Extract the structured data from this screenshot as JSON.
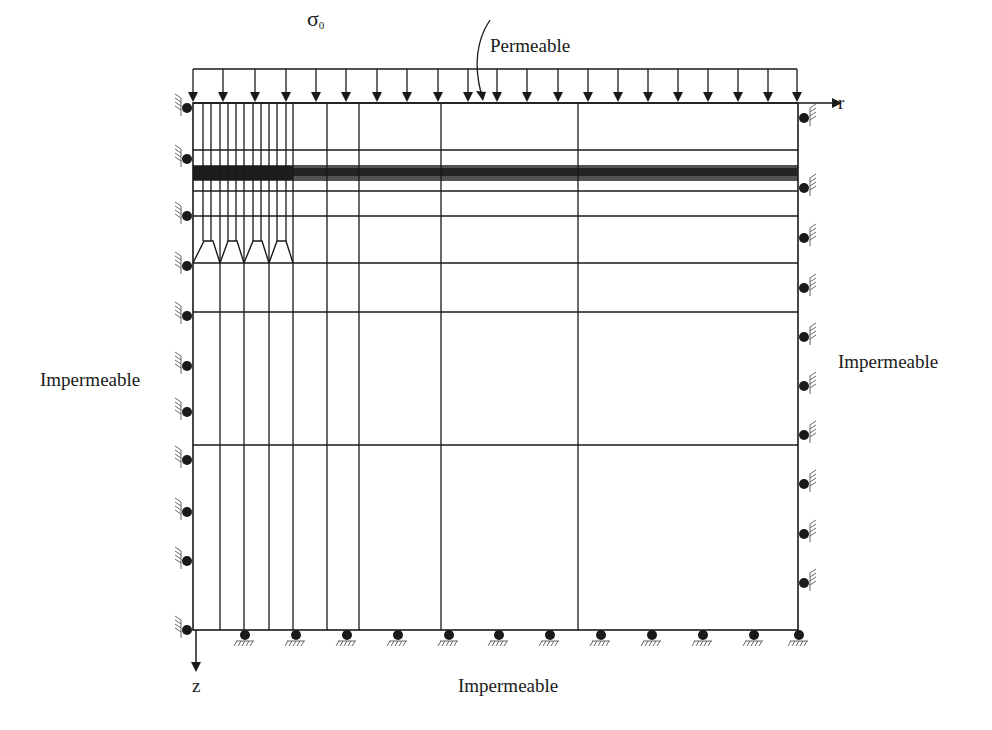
{
  "labels": {
    "load": {
      "symbol": "σ",
      "subscript": "0",
      "x": 307,
      "y": 8
    },
    "permeable_top": {
      "text": "Permeable",
      "x": 490,
      "y": 36
    },
    "impermeable_left": {
      "text": "Impermeable",
      "x": 40,
      "y": 370
    },
    "impermeable_right": {
      "text": "Impermeable",
      "x": 838,
      "y": 352
    },
    "impermeable_bottom": {
      "text": "Impermeable",
      "x": 458,
      "y": 676
    },
    "axis_r": {
      "text": "r",
      "x": 838,
      "y": 93
    },
    "axis_z": {
      "text": "z",
      "x": 192,
      "y": 676
    }
  },
  "colors": {
    "line": "#1a1a1a",
    "fixity_hatch": "#555555",
    "background": "#ffffff"
  },
  "geometry": {
    "domain": {
      "left": 193,
      "right": 798,
      "top": 103,
      "bottom": 630
    },
    "load_box": {
      "left": 193,
      "right": 797,
      "top": 69
    },
    "load_arrow_x": [
      193,
      223,
      255,
      286,
      316,
      346,
      377,
      407,
      438,
      468,
      497,
      527,
      558,
      588,
      618,
      648,
      678,
      708,
      738,
      768,
      797
    ],
    "r_axis": {
      "x_end": 832,
      "y": 103
    },
    "z_axis": {
      "x": 196,
      "y_end": 662
    },
    "permeable_pointer": {
      "start": [
        490,
        20
      ],
      "ctrl": [
        470,
        50
      ],
      "end": [
        485,
        101
      ]
    },
    "fine_columns_x": [
      203,
      211,
      220,
      228,
      236,
      244,
      253,
      261,
      269,
      277,
      286,
      293
    ],
    "mid_columns_x": [
      327,
      359,
      441,
      578
    ],
    "horizontal_rows_y": [
      150,
      166,
      168,
      170,
      172,
      174,
      176,
      178,
      180,
      191,
      216,
      263,
      312,
      445
    ],
    "dense_band": {
      "top": 166,
      "bottom": 180
    },
    "wedges": [
      {
        "left_base": 193,
        "left_top": 204,
        "right_top": 213,
        "right_base": 220
      },
      {
        "left_base": 220,
        "left_top": 228,
        "right_top": 237,
        "right_base": 244
      },
      {
        "left_base": 244,
        "left_top": 253,
        "right_top": 262,
        "right_base": 269
      },
      {
        "left_base": 269,
        "left_top": 277,
        "right_top": 286,
        "right_base": 293
      }
    ],
    "wedge_top_y": 241,
    "wedge_base_y": 263,
    "left_supports_y": [
      108,
      159,
      216,
      266,
      316,
      366,
      412,
      460,
      512,
      561,
      630
    ],
    "right_supports_y": [
      118,
      188,
      238,
      288,
      337,
      386,
      435,
      484,
      534,
      583
    ],
    "bottom_supports_x": [
      245,
      296,
      347,
      398,
      449,
      499,
      550,
      601,
      652,
      703,
      754,
      799
    ]
  }
}
